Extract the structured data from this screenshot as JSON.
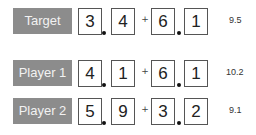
{
  "rows": [
    {
      "label": "Target",
      "digits": [
        "3",
        "4",
        "6",
        "1"
      ],
      "result": "9.5"
    },
    {
      "label": "Player 1",
      "digits": [
        "4",
        "1",
        "6",
        "1"
      ],
      "result": "10.2"
    },
    {
      "label": "Player 2",
      "digits": [
        "5",
        "9",
        "3",
        "2"
      ],
      "result": "9.1"
    }
  ],
  "symbols": {
    "plus": "+"
  },
  "colors": {
    "label_bg": "#8c8c8c",
    "label_text": "#f2f2f2",
    "box_border": "#555555"
  }
}
